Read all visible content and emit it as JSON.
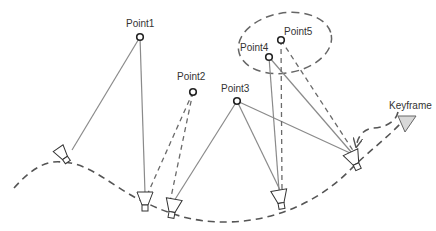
{
  "diagram": {
    "points": [
      {
        "id": "Point1",
        "label": "Point1",
        "x": 140,
        "y": 37
      },
      {
        "id": "Point2",
        "label": "Point2",
        "x": 193,
        "y": 92
      },
      {
        "id": "Point3",
        "label": "Point3",
        "x": 237,
        "y": 101
      },
      {
        "id": "Point4",
        "label": "Point4",
        "x": 269,
        "y": 57
      },
      {
        "id": "Point5",
        "label": "Point5",
        "x": 281,
        "y": 40
      }
    ],
    "cameras": [
      {
        "id": "cam1",
        "x": 65,
        "y": 158,
        "angle": -35
      },
      {
        "id": "cam2",
        "x": 145,
        "y": 200,
        "angle": 0
      },
      {
        "id": "cam3",
        "x": 171,
        "y": 208,
        "angle": 10
      },
      {
        "id": "cam4",
        "x": 280,
        "y": 197,
        "angle": -10
      },
      {
        "id": "cam5",
        "x": 355,
        "y": 158,
        "angle": -25
      }
    ],
    "keyframe_label": "Keyframe",
    "colors": {
      "background": "#ffffff",
      "solid_line": "#8a8a8a",
      "dashed_line": "#6a6a6a",
      "arrow_fill": "#d8d8d8",
      "text": "#333333"
    }
  }
}
